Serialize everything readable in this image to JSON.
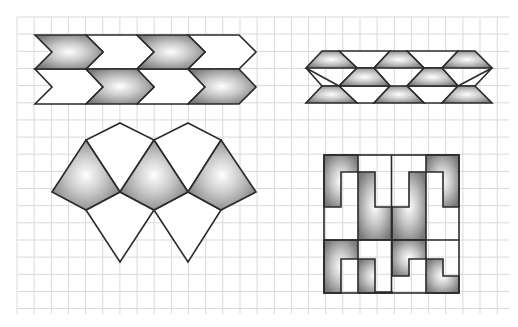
{
  "figure": {
    "background": "#ffffff",
    "grid": {
      "x0": 17,
      "y0": 17,
      "x1": 509,
      "y1": 314,
      "spacing": 17.15,
      "color": "#d9d9d9"
    },
    "stroke_color": "#2a2a2a",
    "shade": {
      "center": "#ffffff",
      "edge": "#7a7a7a"
    },
    "patterns": [
      {
        "name": "chevron-tessellation",
        "position": "top-left",
        "rows": 2,
        "shapes": [
          {
            "type": "chevron",
            "fill": "shaded",
            "points": "35,35 86,35 103,52 86,69 35,69 52,52"
          },
          {
            "type": "chevron",
            "fill": "blank",
            "points": "86,35 137,35 154,52 137,69 86,69 103,52"
          },
          {
            "type": "chevron",
            "fill": "shaded",
            "points": "137,35 188,35 205,52 188,69 137,69 154,52"
          },
          {
            "type": "chevron",
            "fill": "blank",
            "points": "188,35 239,35 256,52 239,69 188,69 205,52"
          },
          {
            "type": "chevron",
            "fill": "blank",
            "points": "35,69 86,69 103,87 86,104 35,104 52,87"
          },
          {
            "type": "chevron",
            "fill": "shaded",
            "points": "86,69 137,69 154,87 137,104 86,104 103,87"
          },
          {
            "type": "chevron",
            "fill": "blank",
            "points": "137,69 188,69 205,87 188,104 137,104 154,87"
          },
          {
            "type": "chevron",
            "fill": "shaded",
            "points": "188,69 239,69 256,87 239,104 188,104 205,87"
          }
        ]
      },
      {
        "name": "trapezoid-tessellation",
        "position": "top-right",
        "shapes": [
          {
            "type": "trapezoid",
            "fill": "shaded",
            "points": "322,51 339,51 357,68 306,68"
          },
          {
            "type": "trapezoid",
            "fill": "shaded",
            "points": "390,51 407,51 424,68 374,68"
          },
          {
            "type": "trapezoid",
            "fill": "shaded",
            "points": "458,51 475,51 492,68 442,68"
          },
          {
            "type": "trapezoid",
            "fill": "shaded",
            "points": "339,86 357,68 374,68 390,86"
          },
          {
            "type": "trapezoid",
            "fill": "shaded",
            "points": "407,86 424,68 442,68 458,86"
          },
          {
            "type": "trapezoid",
            "fill": "shaded",
            "points": "322,86 339,86 357,103 306,103"
          },
          {
            "type": "trapezoid",
            "fill": "shaded",
            "points": "390,86 407,86 424,103 374,103"
          },
          {
            "type": "trapezoid",
            "fill": "shaded",
            "points": "458,86 475,86 492,103 442,103"
          },
          {
            "type": "trapezoid",
            "fill": "blank",
            "points": "339,51 390,51 374,68 357,68"
          },
          {
            "type": "trapezoid",
            "fill": "blank",
            "points": "407,51 458,51 442,68 424,68"
          },
          {
            "type": "trapezoid",
            "fill": "blank",
            "points": "306,68 339,86 322,86"
          },
          {
            "type": "trapezoid",
            "fill": "blank",
            "points": "357,68 374,68 390,86 339,86"
          },
          {
            "type": "trapezoid",
            "fill": "blank",
            "points": "424,68 442,68 458,86 407,86"
          },
          {
            "type": "trapezoid",
            "fill": "blank",
            "points": "492,68 475,86 458,86"
          },
          {
            "type": "trapezoid",
            "fill": "blank",
            "points": "339,86 390,86 374,103 357,103"
          },
          {
            "type": "trapezoid",
            "fill": "blank",
            "points": "407,86 458,86 442,103 424,103"
          }
        ]
      },
      {
        "name": "kite-tessellation",
        "position": "bottom-left",
        "shapes": [
          {
            "type": "kite",
            "fill": "shaded",
            "points": "86,140 120,192 86,210 52,192"
          },
          {
            "type": "kite",
            "fill": "shaded",
            "points": "154,140 188,192 154,210 120,192"
          },
          {
            "type": "kite",
            "fill": "shaded",
            "points": "221,140 256,192 221,210 188,192"
          },
          {
            "type": "kite",
            "fill": "blank",
            "points": "120,123 154,140 120,192 86,140"
          },
          {
            "type": "kite",
            "fill": "blank",
            "points": "188,123 221,140 188,192 154,140"
          },
          {
            "type": "kite",
            "fill": "blank",
            "points": "86,210 120,192 154,210 120,262"
          },
          {
            "type": "kite",
            "fill": "blank",
            "points": "154,210 188,192 221,210 188,262"
          }
        ]
      },
      {
        "name": "key-pattern-square",
        "position": "bottom-right",
        "bounds": {
          "x": 324,
          "y": 155,
          "width": 135,
          "height": 138
        },
        "shapes": [
          {
            "type": "L-hook",
            "fill": "shaded",
            "points": "324,155 358,155 358,172 341,172 341,207 324,207"
          },
          {
            "type": "L-hook",
            "fill": "shaded",
            "points": "358,172 375,172 375,207 392,207 392,240 358,240"
          },
          {
            "type": "L-hook",
            "fill": "shaded",
            "points": "392,207 409,207 409,172 426,172 426,240 392,240"
          },
          {
            "type": "L-hook",
            "fill": "shaded",
            "points": "426,155 459,155 459,207 443,207 443,172 426,172"
          },
          {
            "type": "L-hook",
            "fill": "shaded",
            "points": "324,240 358,240 358,259 341,259 341,293 324,293"
          },
          {
            "type": "L-hook",
            "fill": "shaded",
            "points": "358,259 375,259 375,292 392,292 392,293 358,293"
          },
          {
            "type": "L-hook",
            "fill": "shaded",
            "points": "392,240 426,240 426,259 409,259 409,276 392,276"
          },
          {
            "type": "L-hook",
            "fill": "shaded",
            "points": "426,259 443,259 443,276 459,276 459,293 426,293"
          }
        ]
      }
    ]
  }
}
